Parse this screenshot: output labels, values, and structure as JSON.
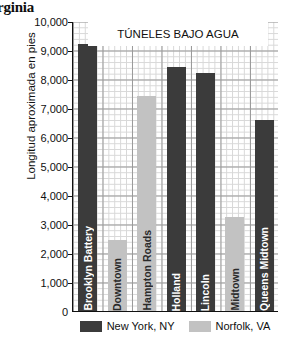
{
  "page_bleed_text": "rginia",
  "chart_data": {
    "type": "bar",
    "title": "TÚNELES BAJO AGUA",
    "xlabel": "",
    "ylabel": "Longitud aproximada en pies",
    "ylim": [
      0,
      10000
    ],
    "ytick_labels": [
      "10,000",
      "9,000",
      "8,000",
      "7,000",
      "6,000",
      "5,000",
      "4,000",
      "3,000",
      "2,000",
      "1,000",
      "0"
    ],
    "ytick_values": [
      10000,
      9000,
      8000,
      7000,
      6000,
      5000,
      4000,
      3000,
      2000,
      1000,
      0
    ],
    "grid": true,
    "legend_position": "bottom",
    "categories": [
      "Brooklyn Battery",
      "Downtown",
      "Hampton Roads",
      "Holland",
      "Lincoln",
      "Midtown",
      "Queens Midtown"
    ],
    "values": [
      9200,
      2450,
      7420,
      8400,
      8200,
      3250,
      6600
    ],
    "groups": [
      "New York, NY",
      "Norfolk, VA",
      "Norfolk, VA",
      "New York, NY",
      "New York, NY",
      "Norfolk, VA",
      "New York, NY"
    ],
    "series": [
      {
        "name": "New York, NY",
        "color": "#3b3b3b",
        "points": [
          {
            "label": "Brooklyn Battery",
            "value": 9200
          },
          {
            "label": "Holland",
            "value": 8400
          },
          {
            "label": "Lincoln",
            "value": 8200
          },
          {
            "label": "Queens Midtown",
            "value": 6600
          }
        ]
      },
      {
        "name": "Norfolk, VA",
        "color": "#c2c2c2",
        "points": [
          {
            "label": "Downtown",
            "value": 2450
          },
          {
            "label": "Hampton Roads",
            "value": 7420
          },
          {
            "label": "Midtown",
            "value": 3250
          }
        ]
      }
    ],
    "legend": [
      {
        "label": "New York, NY",
        "color": "#3b3b3b"
      },
      {
        "label": "Norfolk, VA",
        "color": "#c2c2c2"
      }
    ]
  },
  "colors": {
    "dark_bar": "#3b3b3b",
    "light_bar": "#c2c2c2",
    "axis": "#111111",
    "grid_major": "#9a9a9a",
    "grid_minor": "#d8d8d8",
    "background": "#ffffff"
  }
}
